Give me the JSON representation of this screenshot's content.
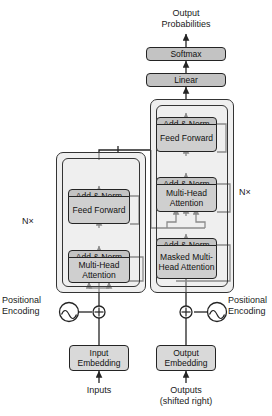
{
  "diagram": {
    "top_labels": {
      "output_probabilities": "Output\nProbabilities"
    },
    "head_boxes": [
      {
        "name": "softmax",
        "label": "Softmax",
        "fill": "#c3c3c3"
      },
      {
        "name": "linear",
        "label": "Linear",
        "fill": "#c3c3c3"
      }
    ],
    "encoder": {
      "repeat_label": "N×",
      "blocks": [
        {
          "name": "add-norm-upper",
          "label": "Add & Norm",
          "fill": "#c3c3c3"
        },
        {
          "name": "feed-forward",
          "label": "Feed\nForward",
          "fill": "#cfcfcf"
        },
        {
          "name": "add-norm-lower",
          "label": "Add & Norm",
          "fill": "#c3c3c3"
        },
        {
          "name": "multi-head-attention",
          "label": "Multi-Head\nAttention",
          "fill": "#cfcfcf"
        }
      ]
    },
    "decoder": {
      "repeat_label": "N×",
      "blocks": [
        {
          "name": "add-norm-top",
          "label": "Add & Norm",
          "fill": "#c3c3c3"
        },
        {
          "name": "feed-forward",
          "label": "Feed\nForward",
          "fill": "#cfcfcf"
        },
        {
          "name": "add-norm-mid",
          "label": "Add & Norm",
          "fill": "#c3c3c3"
        },
        {
          "name": "multi-head-attention",
          "label": "Multi-Head\nAttention",
          "fill": "#cfcfcf"
        },
        {
          "name": "add-norm-bottom",
          "label": "Add & Norm",
          "fill": "#c3c3c3"
        },
        {
          "name": "masked-multi-head-attention",
          "label": "Masked\nMulti-Head\nAttention",
          "fill": "#cfcfcf"
        }
      ]
    },
    "embeddings": {
      "input": {
        "label": "Input\nEmbedding",
        "fill": "#d9d9d9"
      },
      "output": {
        "label": "Output\nEmbedding",
        "fill": "#d9d9d9"
      }
    },
    "positional_encoding": {
      "left_label": "Positional\nEncoding",
      "right_label": "Positional\nEncoding",
      "operator": "⊕",
      "glyph": "sine-wave-circle"
    },
    "bottom_labels": {
      "inputs": "Inputs",
      "outputs": "Outputs\n(shifted right)"
    },
    "colors": {
      "stroke": "#242424",
      "add_norm_fill": "#c3c3c3",
      "sublayer_fill": "#cfcfcf",
      "embedding_fill": "#d9d9d9",
      "background": "#ffffff",
      "stack_fill": "#e2e2e2"
    }
  }
}
